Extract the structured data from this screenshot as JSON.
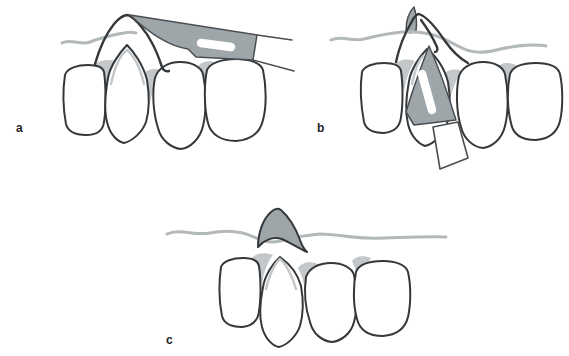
{
  "figure": {
    "panels": [
      {
        "label": "a",
        "depicts": "horizontal scalpel blade with slotted handle laid over the frenum arch above a row of four incisors, with mucogingival line"
      },
      {
        "label": "b",
        "depicts": "scalpel blade angled vertically between the central incisors, tip emerging through the frenum arch"
      },
      {
        "label": "c",
        "depicts": "shaded excised frenum area remaining above the row of four incisors"
      }
    ],
    "teeth_per_panel": 4
  },
  "colors": {
    "background": "#ffffff",
    "outline": "#35383b",
    "outline-soft": "#4a4e52",
    "instrument-gray": "#9ea6aa",
    "tissue-line": "#b3b8ba",
    "interdental-shade": "#c3c7c9",
    "label-text": "#1f2326"
  }
}
